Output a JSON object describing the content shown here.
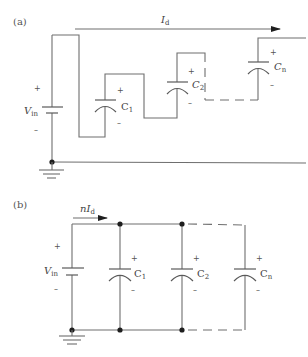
{
  "figure": {
    "panel_a": {
      "label": "(a)",
      "current": {
        "symbol": "I",
        "subscript": "d"
      },
      "source": {
        "symbol": "V",
        "subscript": "in",
        "plus": "+",
        "minus": "–"
      },
      "capacitors": [
        {
          "symbol": "C",
          "subscript": "1",
          "plus": "+",
          "minus": "–"
        },
        {
          "symbol": "C",
          "subscript": "2",
          "plus": "+",
          "minus": "–"
        },
        {
          "symbol": "C",
          "subscript": "n",
          "plus": "+",
          "minus": "–"
        }
      ],
      "connection": "series"
    },
    "panel_b": {
      "label": "(b)",
      "current": {
        "prefix": "n",
        "symbol": "I",
        "subscript": "d"
      },
      "source": {
        "symbol": "V",
        "subscript": "in",
        "plus": "+",
        "minus": "–"
      },
      "capacitors": [
        {
          "symbol": "C",
          "subscript": "1",
          "plus": "+",
          "minus": "–"
        },
        {
          "symbol": "C",
          "subscript": "2",
          "plus": "+",
          "minus": "–"
        },
        {
          "symbol": "C",
          "subscript": "n",
          "plus": "+",
          "minus": "–"
        }
      ],
      "connection": "parallel"
    }
  }
}
